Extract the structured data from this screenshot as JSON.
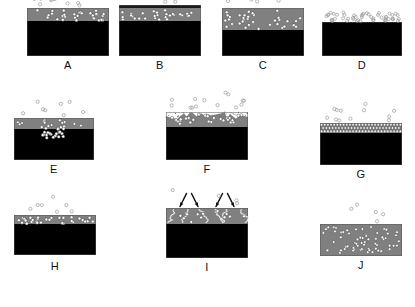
{
  "figure": {
    "type": "schematic-diagram",
    "panel_count": 10,
    "rows": 3,
    "background_color": "#ffffff"
  },
  "colors": {
    "substrate_black": "#000000",
    "layer_gray": "#808080",
    "layer_gray_light": "#999999",
    "layer_gray_dark": "#6e6e6e",
    "cap_dark": "#1a1a1a",
    "particle_fill_white": "#ffffff",
    "particle_fill_open": "none",
    "particle_stroke": "#555555",
    "particle_stroke_light": "#9a9a9a",
    "arrow_color": "#111111",
    "label_color": "#111111",
    "outline_color": "#555555"
  },
  "panels": [
    {
      "id": "A",
      "label": "A",
      "x": 27,
      "y": 8,
      "w": 82,
      "h": 48,
      "variant": "gray-layer-with-embedded-particles",
      "gray_height": 13,
      "black_height": 35,
      "cap": false,
      "free_particles_above": 14,
      "embedded_particles": 30,
      "notes": "Gray surface layer with many filled particles embedded near top; open particles floating above"
    },
    {
      "id": "B",
      "label": "B",
      "x": 119,
      "y": 8,
      "w": 82,
      "h": 48,
      "variant": "gray-layer-with-dark-cap",
      "gray_height": 13,
      "black_height": 35,
      "cap": true,
      "cap_height": 3,
      "free_particles_above": 5,
      "embedded_particles": 30,
      "notes": "Same as A but a thin dark capping line seals the gray layer"
    },
    {
      "id": "C",
      "label": "C",
      "x": 222,
      "y": 8,
      "w": 82,
      "h": 48,
      "variant": "thick-gray-layer-dense-particles",
      "gray_height": 22,
      "black_height": 26,
      "cap": false,
      "free_particles_above": 7,
      "embedded_particles": 36,
      "notes": "Thicker gray layer with particles distributed through its full depth"
    },
    {
      "id": "D",
      "label": "D",
      "x": 322,
      "y": 22,
      "w": 80,
      "h": 34,
      "variant": "bare-substrate-surface-particles",
      "gray_height": 0,
      "black_height": 34,
      "cap": false,
      "free_particles_above": 34,
      "embedded_particles": 0,
      "notes": "Bare black substrate, particles resting on / above the surface only"
    },
    {
      "id": "E",
      "label": "E",
      "x": 14,
      "y": 118,
      "w": 80,
      "h": 42,
      "variant": "localised-penetrating-cluster",
      "gray_height": 11,
      "black_height": 31,
      "cap": false,
      "free_particles_above": 8,
      "embedded_particles": 6,
      "cluster": {
        "x_offset": 26,
        "w": 26,
        "h": 12,
        "count": 26
      },
      "notes": "Dense localised cluster of particles penetrating down into the black substrate at centre"
    },
    {
      "id": "F",
      "label": "F",
      "x": 166,
      "y": 112,
      "w": 82,
      "h": 48,
      "variant": "rough-irregular-gray-top",
      "gray_height": 15,
      "black_height": 33,
      "cap": false,
      "rough_top": true,
      "free_particles_above": 14,
      "embedded_particles": 26,
      "notes": "Gray layer with rough, irregular, nodular upper surface"
    },
    {
      "id": "G",
      "label": "G",
      "x": 320,
      "y": 123,
      "w": 82,
      "h": 42,
      "variant": "dense-monolayer-band",
      "gray_height": 10,
      "black_height": 32,
      "cap": false,
      "free_particles_above": 12,
      "embedded_particles": 84,
      "notes": "Thin band packed with a dense close-packed monolayer of small particles"
    },
    {
      "id": "H",
      "label": "H",
      "x": 14,
      "y": 215,
      "w": 82,
      "h": 42,
      "variant": "thin-gray-band",
      "gray_height": 9,
      "black_height": 31,
      "cap": false,
      "free_particles_above": 7,
      "embedded_particles": 32,
      "notes": "Thin gray band on substrate, particles concentrated in the band"
    },
    {
      "id": "I",
      "label": "I",
      "x": 166,
      "y": 208,
      "w": 82,
      "h": 50,
      "variant": "ion-bombardment-with-tracks",
      "gray_height": 16,
      "black_height": 34,
      "cap": false,
      "arrows": 4,
      "free_particles_above": 4,
      "embedded_particles": 12,
      "tracks": 6,
      "notes": "Incoming energetic species (arrows) create squiggly damage tracks through the gray layer"
    },
    {
      "id": "J",
      "label": "J",
      "x": 320,
      "y": 224,
      "w": 82,
      "h": 32,
      "variant": "fully-gray-dispersed-particles",
      "gray_height": 32,
      "black_height": 0,
      "cap": false,
      "free_particles_above": 5,
      "embedded_particles": 62,
      "notes": "Entirely gray body, particles dispersed uniformly throughout; no black substrate"
    }
  ]
}
